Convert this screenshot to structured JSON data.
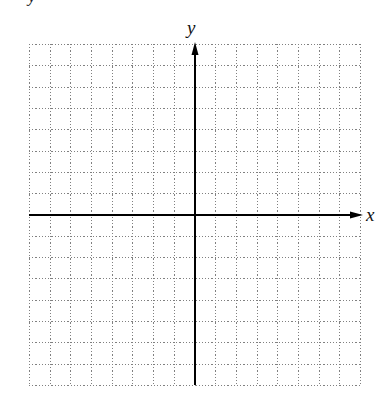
{
  "figure": {
    "top_fragment_text": "y",
    "x_axis_label": "x",
    "y_axis_label": "y",
    "grid": {
      "columns": 16,
      "rows": 16,
      "left": 29,
      "top": 44,
      "right": 360,
      "bottom": 385,
      "line_style": "dotted",
      "line_color": "#808080"
    },
    "axes": {
      "origin_column": 8,
      "origin_row": 8,
      "color": "#000000",
      "stroke_width": 2,
      "x_arrow_tip": 363,
      "y_arrow_tip": 42
    },
    "label_positions": {
      "x_label": {
        "left": 366,
        "top": 205
      },
      "y_label": {
        "left": 187,
        "top": 18
      }
    }
  }
}
